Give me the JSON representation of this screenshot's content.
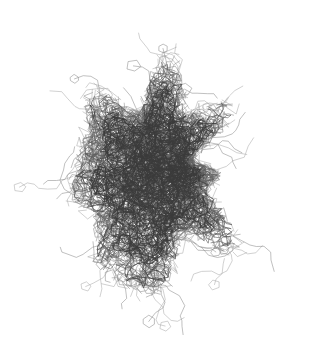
{
  "figure": {
    "kind": "molecular-wireframe",
    "title": "",
    "caption": "",
    "width": 310,
    "height": 357,
    "background_color": "#ffffff",
    "stroke_colors": {
      "core_dark": "#3a3a3a",
      "mid_gray": "#5f5f5f",
      "light_gray": "#8c8c8c",
      "faint_gray": "#ababab"
    },
    "stroke_widths": {
      "core": 0.72,
      "mid": 0.62,
      "light": 0.55
    },
    "bounds": {
      "left": 18,
      "right": 296,
      "top": 14,
      "bottom": 336,
      "center_x": 155,
      "center_y": 172
    },
    "density": {
      "core_radius_x": 78,
      "core_radius_y": 95,
      "core_segments": 1500,
      "shell_segments": 620,
      "sidechain_rings": 46,
      "protruding_chains": 34
    },
    "render": {
      "grid": false,
      "legend": false,
      "axes": false,
      "labels": false
    },
    "seed": 20240417
  },
  "chart_data": {
    "type": "scatter",
    "title": "",
    "xlabel": "",
    "ylabel": "",
    "note": "no axes, ticks, legend or numeric labels are rendered in the image"
  }
}
